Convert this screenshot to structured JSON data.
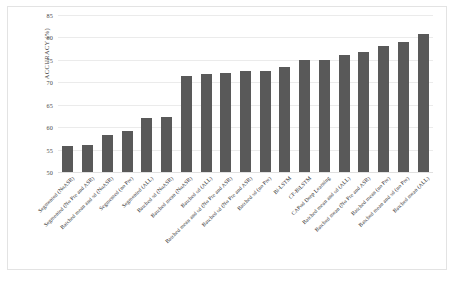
{
  "chart_data": {
    "type": "bar",
    "title": "",
    "xlabel": "",
    "ylabel": "ACCURACY (%)",
    "ylim": [
      50,
      85
    ],
    "yticks": [
      50,
      55,
      60,
      65,
      70,
      75,
      80,
      85
    ],
    "grid": true,
    "legend": "none",
    "bar_color": "#595959",
    "categories": [
      "Segmented (NoASR)",
      "Segmented (No Pre and ASR)",
      "Batched mean and sd (NoASR)",
      "Segmented (no Pre)",
      "Segmented (ALL)",
      "Batched sd (NoASR)",
      "Batched mean (NoASR)",
      "Batched sd (ALL)",
      "Batched mean and sd (No Pre and ASR)",
      "Batched sd (No Pre and ASR)",
      "Batched sd (no Pre)",
      "Bi-LSTM",
      "CF-BiLSTM",
      "CAPod Deep Learning",
      "Batched mean and sd (ALL)",
      "Batched mean (No Pre and ASR)",
      "Batched mean (no Pre)",
      "Batched mean and sd (no Pre)",
      "Batched mean (ALL)"
    ],
    "values": [
      55.7,
      56.1,
      58.3,
      59.2,
      62.0,
      62.2,
      71.4,
      71.9,
      72.1,
      72.5,
      72.6,
      73.3,
      74.9,
      74.9,
      76.0,
      76.7,
      78.1,
      79.0,
      80.8
    ]
  },
  "axis": {
    "y_title": "ACCURACY (%)"
  }
}
